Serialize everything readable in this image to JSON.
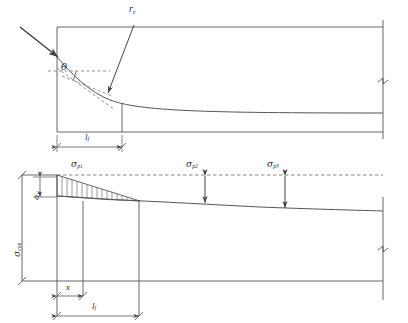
{
  "figure": {
    "domain": "engineering-diagram",
    "stroke_color": "#555555",
    "dash_color": "#666666",
    "background": "#ffffff"
  },
  "upper_diagram": {
    "name": "tendon-profile",
    "labels": {
      "radius": {
        "symbol": "r",
        "sub": "c"
      },
      "angle": {
        "symbol": "θ"
      },
      "reverse_friction_length": {
        "symbol": "l",
        "sub": "f"
      }
    },
    "annotations": {
      "load_arrow": "arrow pointing to anchorage end",
      "radius_arrow": "leader from r_c to curved tendon",
      "break_symbol": "section break at right end"
    }
  },
  "lower_diagram": {
    "name": "stress-distribution",
    "labels": {
      "stress_p1": {
        "symbol": "σ",
        "sub": "p1"
      },
      "stress_p2": {
        "symbol": "σ",
        "sub": "p2"
      },
      "stress_p3": {
        "symbol": "σ",
        "sub": "p3"
      },
      "loss_l1": {
        "symbol": "σ",
        "sub": "l1"
      },
      "stress_con": {
        "symbol": "σ",
        "sub": "con"
      },
      "distance_x": {
        "symbol": "x"
      },
      "reverse_friction_length": {
        "symbol": "l",
        "sub": "f"
      }
    },
    "annotations": {
      "hatched_region": "triangular hatched prestress loss area",
      "dashed_baseline": "horizontal dashed reference line",
      "break_symbol": "section break at right end"
    }
  },
  "geometry": {
    "upper_box": {
      "x": 57,
      "y": 27,
      "width": 326,
      "height": 105
    },
    "lower_axis": {
      "x": 22,
      "y": 175,
      "width": 361,
      "height": 105
    },
    "lf_upper_px": 65,
    "lf_lower_px": 82,
    "x_dim_px": 26
  }
}
